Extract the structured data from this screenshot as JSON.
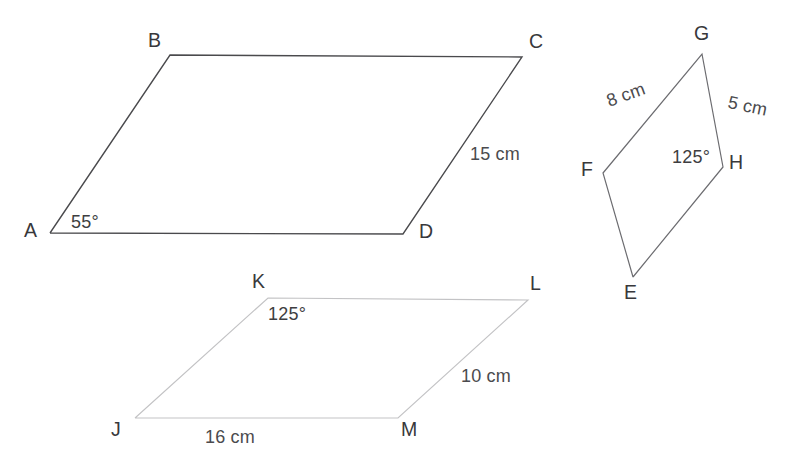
{
  "figure": {
    "title_hidden": "",
    "canvas": {
      "width": 789,
      "height": 473,
      "background": "#ffffff"
    },
    "shapes": [
      {
        "id": "parallelogram-abcd",
        "name": "ABCD",
        "stroke": "#4a4a4d",
        "points": "50,233 170,55 522,57 403,234 50,233",
        "vertices": [
          {
            "label": "A",
            "x": 50,
            "y": 233
          },
          {
            "label": "B",
            "x": 170,
            "y": 55
          },
          {
            "label": "C",
            "x": 522,
            "y": 57
          },
          {
            "label": "D",
            "x": 403,
            "y": 234
          }
        ]
      },
      {
        "id": "parallelogram-efgh",
        "name": "EFGH",
        "stroke": "#6c6c70",
        "points": "633,277 603,173 702,54 723,167 633,277",
        "vertices": [
          {
            "label": "E",
            "x": 633,
            "y": 277
          },
          {
            "label": "F",
            "x": 603,
            "y": 173
          },
          {
            "label": "G",
            "x": 702,
            "y": 54
          },
          {
            "label": "H",
            "x": 723,
            "y": 167
          }
        ]
      },
      {
        "id": "parallelogram-jklm",
        "name": "JKLM",
        "stroke": "#c3c3c5",
        "points": "135,418 268,298 528,300 398,418 135,418",
        "vertices": [
          {
            "label": "J",
            "x": 135,
            "y": 418
          },
          {
            "label": "K",
            "x": 268,
            "y": 298
          },
          {
            "label": "L",
            "x": 528,
            "y": 300
          },
          {
            "label": "M",
            "x": 398,
            "y": 418
          }
        ]
      }
    ],
    "vertex_labels": {
      "a": "A",
      "b": "B",
      "c": "C",
      "d": "D",
      "e": "E",
      "f": "F",
      "g": "G",
      "h": "H",
      "j": "J",
      "k": "K",
      "l": "L",
      "m": "M"
    },
    "measurements": {
      "cd_length": "15 cm",
      "fg_length": "8 cm",
      "gh_length": "5 cm",
      "lm_length": "10 cm",
      "jm_length": "16 cm"
    },
    "angles": {
      "angle_a": "55°",
      "angle_h": "125°",
      "angle_k": "125°"
    }
  }
}
